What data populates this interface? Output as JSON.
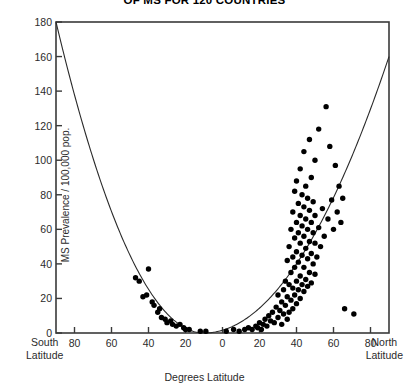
{
  "chart_data": {
    "type": "scatter",
    "title": "OF MS FOR 120 COUNTRIES",
    "title_note": "title is clipped at the top edge of the screenshot",
    "xlabel": "Degrees Latitude",
    "ylabel": "MS Prevalence / 100,000 pop.",
    "xlim": [
      -90,
      90
    ],
    "ylim": [
      0,
      180
    ],
    "grid": false,
    "legend": null,
    "x_axis": {
      "left_edge_label": [
        "South",
        "Latitude"
      ],
      "right_edge_label": [
        "North",
        "Latitude"
      ],
      "tick_values": [
        -80,
        -60,
        -40,
        -20,
        0,
        20,
        40,
        60,
        80
      ],
      "tick_labels": [
        "80",
        "60",
        "40",
        "20",
        "0",
        "20",
        "40",
        "60",
        "80"
      ]
    },
    "y_axis": {
      "tick_values": [
        0,
        20,
        40,
        60,
        80,
        100,
        120,
        140,
        160,
        180
      ],
      "tick_labels": [
        "0",
        "20",
        "40",
        "60",
        "80",
        "100",
        "120",
        "140",
        "160",
        "180"
      ]
    },
    "series": [
      {
        "name": "Countries",
        "marker": "filled-circle",
        "color": "#000000",
        "points": [
          [
            -47,
            32
          ],
          [
            -45,
            30
          ],
          [
            -43,
            21
          ],
          [
            -41,
            22
          ],
          [
            -40,
            37
          ],
          [
            -38,
            18
          ],
          [
            -37,
            16
          ],
          [
            -35,
            12
          ],
          [
            -34,
            14
          ],
          [
            -33,
            9
          ],
          [
            -31,
            8
          ],
          [
            -30,
            6
          ],
          [
            -28,
            7
          ],
          [
            -27,
            5
          ],
          [
            -25,
            4
          ],
          [
            -23,
            5
          ],
          [
            -21,
            3
          ],
          [
            -20,
            2
          ],
          [
            -18,
            2
          ],
          [
            -12,
            1
          ],
          [
            -9,
            1
          ],
          [
            2,
            1
          ],
          [
            6,
            2
          ],
          [
            9,
            1
          ],
          [
            12,
            2
          ],
          [
            14,
            3
          ],
          [
            16,
            2
          ],
          [
            18,
            4
          ],
          [
            19,
            3
          ],
          [
            20,
            6
          ],
          [
            21,
            2
          ],
          [
            22,
            5
          ],
          [
            23,
            8
          ],
          [
            24,
            4
          ],
          [
            25,
            10
          ],
          [
            26,
            7
          ],
          [
            27,
            12
          ],
          [
            28,
            6
          ],
          [
            29,
            15
          ],
          [
            30,
            9
          ],
          [
            30,
            22
          ],
          [
            31,
            13
          ],
          [
            32,
            18
          ],
          [
            32,
            5
          ],
          [
            33,
            25
          ],
          [
            33,
            11
          ],
          [
            34,
            30
          ],
          [
            34,
            16
          ],
          [
            35,
            8
          ],
          [
            35,
            21
          ],
          [
            35,
            42
          ],
          [
            36,
            12
          ],
          [
            36,
            28
          ],
          [
            36,
            50
          ],
          [
            37,
            19
          ],
          [
            37,
            35
          ],
          [
            37,
            60
          ],
          [
            38,
            14
          ],
          [
            38,
            26
          ],
          [
            38,
            44
          ],
          [
            38,
            70
          ],
          [
            39,
            22
          ],
          [
            39,
            38
          ],
          [
            39,
            55
          ],
          [
            39,
            82
          ],
          [
            40,
            17
          ],
          [
            40,
            30
          ],
          [
            40,
            47
          ],
          [
            40,
            64
          ],
          [
            40,
            88
          ],
          [
            41,
            25
          ],
          [
            41,
            41
          ],
          [
            41,
            58
          ],
          [
            41,
            75
          ],
          [
            42,
            20
          ],
          [
            42,
            33
          ],
          [
            42,
            52
          ],
          [
            42,
            68
          ],
          [
            42,
            95
          ],
          [
            43,
            28
          ],
          [
            43,
            45
          ],
          [
            43,
            62
          ],
          [
            43,
            80
          ],
          [
            44,
            24
          ],
          [
            44,
            38
          ],
          [
            44,
            56
          ],
          [
            44,
            73
          ],
          [
            44,
            105
          ],
          [
            45,
            31
          ],
          [
            45,
            49
          ],
          [
            45,
            66
          ],
          [
            45,
            85
          ],
          [
            46,
            27
          ],
          [
            46,
            43
          ],
          [
            46,
            60
          ],
          [
            46,
            78
          ],
          [
            47,
            35
          ],
          [
            47,
            53
          ],
          [
            47,
            71
          ],
          [
            47,
            112
          ],
          [
            48,
            29
          ],
          [
            48,
            46
          ],
          [
            48,
            64
          ],
          [
            48,
            90
          ],
          [
            49,
            40
          ],
          [
            49,
            58
          ],
          [
            49,
            76
          ],
          [
            50,
            34
          ],
          [
            50,
            52
          ],
          [
            50,
            68
          ],
          [
            50,
            100
          ],
          [
            51,
            44
          ],
          [
            52,
            61
          ],
          [
            52,
            118
          ],
          [
            53,
            50
          ],
          [
            54,
            72
          ],
          [
            55,
            56
          ],
          [
            56,
            131
          ],
          [
            57,
            66
          ],
          [
            58,
            108
          ],
          [
            59,
            77
          ],
          [
            60,
            60
          ],
          [
            61,
            97
          ],
          [
            62,
            70
          ],
          [
            63,
            85
          ],
          [
            64,
            64
          ],
          [
            65,
            78
          ],
          [
            66,
            14
          ],
          [
            71,
            11
          ]
        ]
      }
    ],
    "fitted_curve": {
      "name": "fitted U-shaped trend",
      "style": "solid thin black line",
      "vertex_x": -10,
      "vertex_y": 0,
      "left_endpoint": [
        -90,
        180
      ],
      "right_endpoint": [
        90,
        160
      ],
      "description": "Parabolic fit, minimum near 10 degrees South, rising toward both poles"
    }
  }
}
